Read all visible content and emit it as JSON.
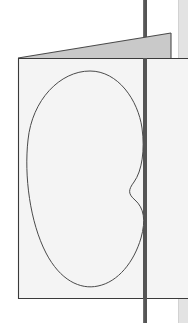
{
  "scene": {
    "title": "Folded panel with kidney-shaped outline",
    "width": 188,
    "height": 323,
    "background_color": "#ffffff"
  },
  "colors": {
    "background": "#ffffff",
    "panel_face": "#f4f4f4",
    "panel_face_edge": "#3a3a3a",
    "flap_fill": "#c9c9c9",
    "flap_edge": "#4a4a4a",
    "post_dark": "#545454",
    "post_highlight": "#6e6e6e",
    "right_strip": "#e3e3e3",
    "right_strip_edge": "#d2d2d2",
    "blob_stroke": "#4a4a4a",
    "blob_fill": "#f4f4f4"
  },
  "elements": {
    "post": {
      "label": "vertical post",
      "x": 143,
      "width": 4,
      "top": 0,
      "bottom": 323
    },
    "right_strip": {
      "label": "background vertical strip",
      "x": 178,
      "width": 10,
      "top": 0,
      "bottom": 323
    },
    "flap": {
      "label": "folded top flap",
      "points": "18,58 171,33 171,58 18,58"
    },
    "panel": {
      "label": "panel face",
      "points": "18,58 188,58 188,299 18,299"
    },
    "blob": {
      "label": "kidney outline",
      "path": "M 90,71 C 60,71 32,100 28,140 C 24,176 30,222 46,253 C 60,280 80,290 98,286 C 118,282 134,262 141,238 C 146,220 144,208 135,200 C 128,194 128,190 134,182 C 142,171 145,150 142,128 C 138,100 118,71 90,71 Z",
      "stroke_width": 1,
      "bounds": {
        "left": 27,
        "top": 71,
        "right": 146,
        "bottom": 287
      }
    }
  }
}
